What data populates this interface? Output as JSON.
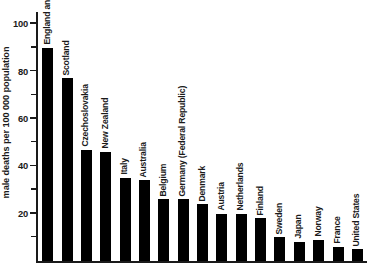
{
  "chart_data": {
    "type": "bar",
    "title": "",
    "xlabel": "",
    "ylabel": "male deaths per 100 000 population",
    "ylim": [
      0,
      105
    ],
    "grid": false,
    "legend": "none",
    "yticks": [
      20,
      40,
      60,
      80,
      100
    ],
    "ytick_labels": [
      "20",
      "40",
      "60",
      "80",
      "100"
    ],
    "yminor_ticks": [
      10,
      30,
      50,
      70,
      90
    ],
    "categories": [
      "England and Wales",
      "Scotland",
      "Czechoslovakia",
      "New Zealand",
      "Italy",
      "Australia",
      "Belgium",
      "Germany (Federal Republic)",
      "Denmark",
      "Austria",
      "Netherlands",
      "Finland",
      "Sweden",
      "Japan",
      "Norway",
      "France",
      "United States"
    ],
    "values": [
      90,
      77,
      47,
      46,
      35,
      34,
      26,
      26,
      24,
      20,
      20,
      18,
      10,
      8,
      9,
      6,
      5
    ],
    "bar_color": "#000000"
  }
}
